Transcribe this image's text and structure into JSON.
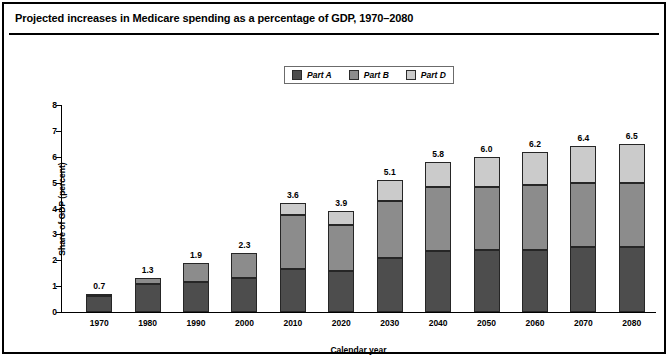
{
  "figure": {
    "title": "Projected increases in Medicare spending as a percentage of GDP, 1970–2080",
    "frame_color": "#000000",
    "background": "#ffffff"
  },
  "legend": {
    "position": "top-center",
    "entries": [
      {
        "label": "Part A",
        "color": "#4d4d4d"
      },
      {
        "label": "Part B",
        "color": "#8c8c8c"
      },
      {
        "label": "Part D",
        "color": "#cbcbcb"
      }
    ]
  },
  "chart_data": {
    "type": "bar",
    "stacked": true,
    "title": "Projected increases in Medicare spending as a percentage of GDP, 1970–2080",
    "xlabel": "Calendar year",
    "ylabel": "Share of GDP (percent)",
    "categories": [
      "1970",
      "1980",
      "1990",
      "2000",
      "2010",
      "2020",
      "2030",
      "2040",
      "2050",
      "2060",
      "2070",
      "2080"
    ],
    "series": [
      {
        "name": "Part A",
        "color": "#4d4d4d",
        "values": [
          0.6,
          1.1,
          1.15,
          1.3,
          1.65,
          1.6,
          2.1,
          2.35,
          2.4,
          2.4,
          2.5,
          2.5
        ]
      },
      {
        "name": "Part B",
        "color": "#8c8c8c",
        "values": [
          0.1,
          0.2,
          0.75,
          1.0,
          2.1,
          1.75,
          2.2,
          2.5,
          2.45,
          2.5,
          2.5,
          2.5
        ]
      },
      {
        "name": "Part D",
        "color": "#cbcbcb",
        "values": [
          0.0,
          0.0,
          0.0,
          0.0,
          0.45,
          0.55,
          0.8,
          0.95,
          1.15,
          1.3,
          1.4,
          1.5
        ]
      }
    ],
    "totals": [
      "0.7",
      "1.3",
      "1.9",
      "2.3",
      "3.6",
      "3.9",
      "5.1",
      "5.8",
      "6.0",
      "6.2",
      "6.4",
      "6.5"
    ],
    "ylim": [
      0,
      8
    ],
    "yticks": [
      "0",
      "1",
      "2",
      "3",
      "4",
      "5",
      "6",
      "7",
      "8"
    ],
    "grid": false,
    "legend_position": "top-center"
  }
}
